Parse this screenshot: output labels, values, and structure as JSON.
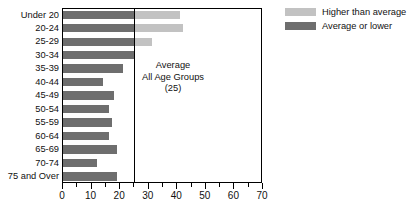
{
  "chart_data": {
    "type": "bar",
    "orientation": "horizontal",
    "title": "",
    "xlabel": "",
    "ylabel": "",
    "xlim": [
      0,
      70
    ],
    "grid": false,
    "categories": [
      "Under 20",
      "20-24",
      "25-29",
      "30-34",
      "35-39",
      "40-44",
      "45-49",
      "50-54",
      "55-59",
      "60-64",
      "65-69",
      "70-74",
      "75 and Over"
    ],
    "values": [
      41,
      42,
      31,
      25,
      21,
      14,
      18,
      16,
      17,
      16,
      19,
      12,
      19
    ],
    "xticks": [
      0,
      10,
      20,
      30,
      40,
      50,
      60,
      70
    ],
    "xtick_labels": [
      "0",
      "10",
      "20",
      "30",
      "40",
      "50",
      "60",
      "70"
    ],
    "xtick_minor_step": 5,
    "reference_line": {
      "value": 25,
      "label_lines": [
        "Average",
        "All Age Groups",
        "(25)"
      ]
    },
    "legend": {
      "position": "top-right",
      "entries": [
        {
          "label": "Higher than average",
          "color": "#c2c2c2"
        },
        {
          "label": "Average or lower",
          "color": "#6e6e6e"
        }
      ]
    },
    "colors": {
      "below_or_equal_average": "#6e6e6e",
      "above_average": "#c2c2c2",
      "axis": "#000000",
      "background": "#ffffff"
    }
  }
}
